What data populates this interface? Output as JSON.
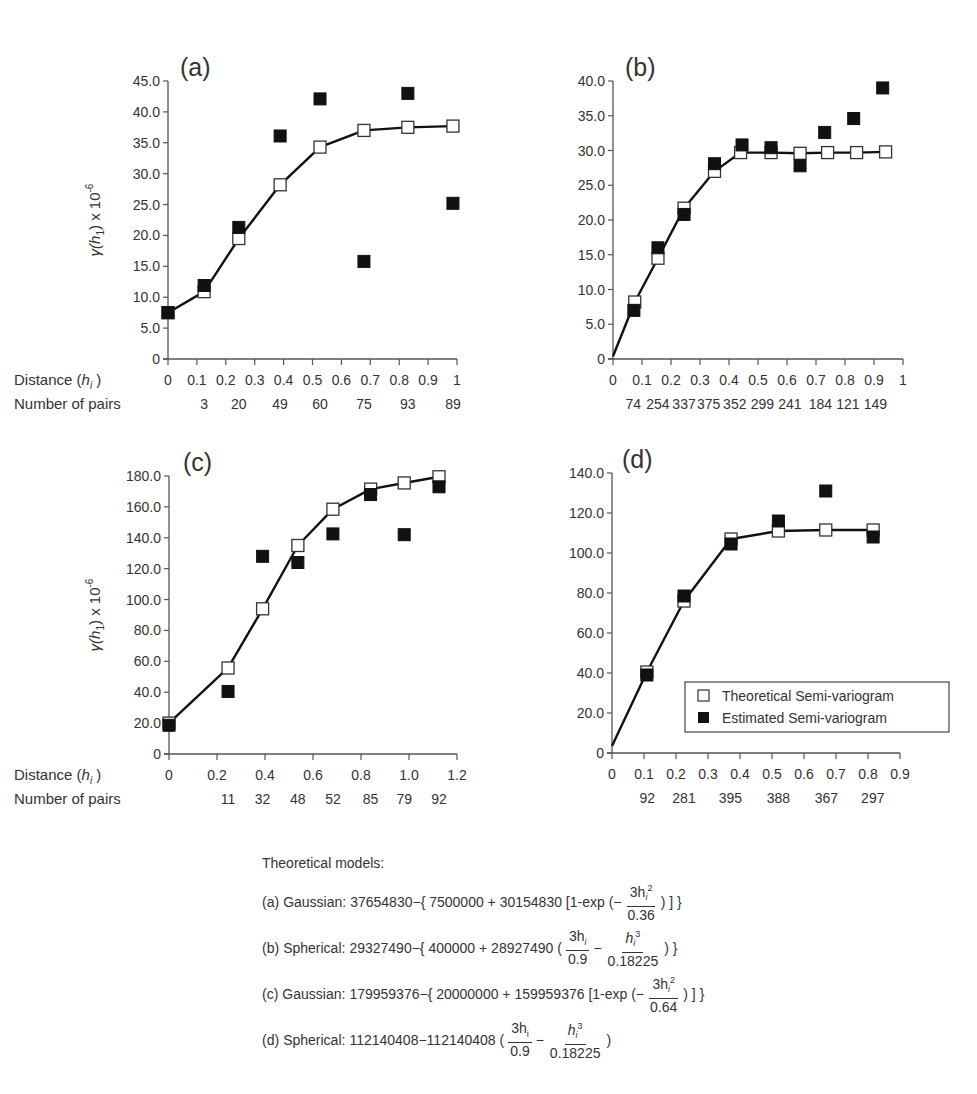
{
  "legend": {
    "theoretical": "Theoretical Semi-variogram",
    "estimated": "Estimated Semi-variogram"
  },
  "common": {
    "distance_label": "Distance (",
    "distance_var": "h",
    "distance_sub": "i",
    "pairs_label": "Number of pairs",
    "ylabel_text": "γ(h",
    "ylabel_sub": "1",
    "ylabel_suffix": ") x 10",
    "ylabel_exp": "-6"
  },
  "models": {
    "heading": "Theoretical models:",
    "a": {
      "tag": "(a)",
      "name": "Gaussian:",
      "expr1": "37654830−{ 7500000 + 30154830 [1-exp (−",
      "num": "3h",
      "num_sub": "i",
      "num_sup": "2",
      "den": "0.36",
      "expr2": ") ] }"
    },
    "b": {
      "tag": "(b)",
      "name": "Spherical:",
      "expr1": "29327490−{ 400000 + 28927490 (",
      "f1_num": "3h",
      "f1_sub": "i",
      "f1_den": "0.9",
      "minus": "−",
      "f2_num": "h",
      "f2_sub": "i",
      "f2_sup": "3",
      "f2_den": "0.18225",
      "expr2": ") }"
    },
    "c": {
      "tag": "(c)",
      "name": "Gaussian:",
      "expr1": "179959376−{ 20000000 + 159959376 [1-exp (−",
      "num": "3h",
      "num_sub": "i",
      "num_sup": "2",
      "den": "0.64",
      "expr2": ") ] }"
    },
    "d": {
      "tag": "(d)",
      "name": "Spherical:",
      "expr1": "112140408−112140408 (",
      "f1_num": "3h",
      "f1_sub": "i",
      "f1_den": "0.9",
      "minus": "−",
      "f2_num": "h",
      "f2_sub": "i",
      "f2_sup": "3",
      "f2_den": "0.18225",
      "expr2": ")"
    }
  },
  "chart_data": [
    {
      "id": "a",
      "type": "line+scatter",
      "title": "(a)",
      "xlabel": "Distance (h_i)",
      "ylabel": "γ(h1) x 10^-6",
      "xlim": [
        0,
        1
      ],
      "ylim": [
        0,
        45
      ],
      "xticks": [
        0,
        0.1,
        0.2,
        0.3,
        0.4,
        0.5,
        0.6,
        0.7,
        0.8,
        0.9,
        1
      ],
      "xtick_labels": [
        "0",
        "0.1",
        "0.2",
        "0.3",
        "0.4",
        "0.5",
        "0.6",
        "0.7",
        "0.8",
        "0.9",
        "1"
      ],
      "yticks": [
        0,
        5,
        10,
        15,
        20,
        25,
        30,
        35,
        40,
        45
      ],
      "ytick_labels": [
        "0",
        "5.0",
        "10.0",
        "15.0",
        "20.0",
        "25.0",
        "30.0",
        "35.0",
        "40.0",
        "45.0"
      ],
      "show_row_labels": true,
      "pairs": [
        {
          "x": 0.125,
          "n": "3"
        },
        {
          "x": 0.245,
          "n": "20"
        },
        {
          "x": 0.388,
          "n": "49"
        },
        {
          "x": 0.526,
          "n": "60"
        },
        {
          "x": 0.678,
          "n": "75"
        },
        {
          "x": 0.83,
          "n": "93"
        },
        {
          "x": 0.986,
          "n": "89"
        }
      ],
      "series": [
        {
          "name": "Theoretical Semi-variogram",
          "style": "open-square-line",
          "x": [
            0,
            0.125,
            0.245,
            0.388,
            0.526,
            0.678,
            0.83,
            0.986
          ],
          "y": [
            7.5,
            10.9,
            19.5,
            28.2,
            34.3,
            37.0,
            37.5,
            37.7
          ]
        },
        {
          "name": "Estimated Semi-variogram",
          "style": "filled-square",
          "x": [
            0,
            0.125,
            0.245,
            0.388,
            0.526,
            0.678,
            0.83,
            0.986
          ],
          "y": [
            7.5,
            11.9,
            21.3,
            36.1,
            42.1,
            15.8,
            43.0,
            25.2
          ]
        }
      ]
    },
    {
      "id": "b",
      "type": "line+scatter",
      "title": "(b)",
      "xlabel": "Distance (h_i)",
      "ylabel": "",
      "xlim": [
        0,
        1
      ],
      "ylim": [
        0,
        40
      ],
      "xticks": [
        0,
        0.1,
        0.2,
        0.3,
        0.4,
        0.5,
        0.6,
        0.7,
        0.8,
        0.9,
        1
      ],
      "xtick_labels": [
        "0",
        "0.1",
        "0.2",
        "0.3",
        "0.4",
        "0.5",
        "0.6",
        "0.7",
        "0.8",
        "0.9",
        "1"
      ],
      "yticks": [
        0,
        5,
        10,
        15,
        20,
        25,
        30,
        35,
        40
      ],
      "ytick_labels": [
        "0",
        "5.0",
        "10.0",
        "15.0",
        "20.0",
        "25.0",
        "30.0",
        "35.0",
        "40.0"
      ],
      "show_row_labels": false,
      "pairs": [
        {
          "x": 0.07,
          "n": "74"
        },
        {
          "x": 0.155,
          "n": "254"
        },
        {
          "x": 0.245,
          "n": "337"
        },
        {
          "x": 0.33,
          "n": "375"
        },
        {
          "x": 0.42,
          "n": "352"
        },
        {
          "x": 0.515,
          "n": "299"
        },
        {
          "x": 0.61,
          "n": "241"
        },
        {
          "x": 0.715,
          "n": "184"
        },
        {
          "x": 0.81,
          "n": "121"
        },
        {
          "x": 0.905,
          "n": "149"
        }
      ],
      "series": [
        {
          "name": "Theoretical Semi-variogram",
          "style": "open-square-line",
          "line_start": [
            0,
            0.4
          ],
          "x": [
            0.075,
            0.155,
            0.245,
            0.35,
            0.44,
            0.545,
            0.645,
            0.74,
            0.84,
            0.94
          ],
          "y": [
            8.2,
            14.5,
            21.7,
            27.0,
            29.7,
            29.7,
            29.6,
            29.7,
            29.7,
            29.8
          ]
        },
        {
          "name": "Estimated Semi-variogram",
          "style": "filled-square",
          "x": [
            0.072,
            0.155,
            0.245,
            0.35,
            0.445,
            0.545,
            0.645,
            0.73,
            0.83,
            0.93
          ],
          "y": [
            7.0,
            16.0,
            20.8,
            28.1,
            30.8,
            30.4,
            27.8,
            32.6,
            34.6,
            39.0
          ]
        }
      ]
    },
    {
      "id": "c",
      "type": "line+scatter",
      "title": "(c)",
      "xlabel": "Distance (h_i)",
      "ylabel": "γ(h1) x 10^-6",
      "xlim": [
        0,
        1.2
      ],
      "ylim": [
        0,
        180
      ],
      "xticks": [
        0,
        0.2,
        0.4,
        0.6,
        0.8,
        1.0,
        1.2
      ],
      "xtick_labels": [
        "0",
        "0.2",
        "0.4",
        "0.6",
        "0.8",
        "1.0",
        "1.2"
      ],
      "yticks": [
        0,
        20,
        40,
        60,
        80,
        100,
        120,
        140,
        160,
        180
      ],
      "ytick_labels": [
        "0",
        "20.0",
        "40.0",
        "60.0",
        "80.0",
        "100.0",
        "120.0",
        "140.0",
        "160.0",
        "180.0"
      ],
      "show_row_labels": true,
      "pairs": [
        {
          "x": 0.246,
          "n": "11"
        },
        {
          "x": 0.39,
          "n": "32"
        },
        {
          "x": 0.537,
          "n": "48"
        },
        {
          "x": 0.683,
          "n": "52"
        },
        {
          "x": 0.84,
          "n": "85"
        },
        {
          "x": 0.98,
          "n": "79"
        },
        {
          "x": 1.125,
          "n": "92"
        }
      ],
      "series": [
        {
          "name": "Theoretical Semi-variogram",
          "style": "open-square-line",
          "x": [
            0,
            0.246,
            0.39,
            0.537,
            0.683,
            0.84,
            0.98,
            1.125
          ],
          "y": [
            20.0,
            55.7,
            94.0,
            135.0,
            158.5,
            171.5,
            175.5,
            179.5
          ]
        },
        {
          "name": "Estimated Semi-variogram",
          "style": "filled-square",
          "x": [
            0,
            0.246,
            0.39,
            0.537,
            0.683,
            0.84,
            0.98,
            1.125
          ],
          "y": [
            18.6,
            40.5,
            128.0,
            124.0,
            142.5,
            168.0,
            142.0,
            173.0
          ]
        }
      ]
    },
    {
      "id": "d",
      "type": "line+scatter",
      "title": "(d)",
      "xlabel": "Distance (h_i)",
      "ylabel": "",
      "xlim": [
        0,
        0.9
      ],
      "ylim": [
        0,
        140
      ],
      "xticks": [
        0,
        0.1,
        0.2,
        0.3,
        0.4,
        0.5,
        0.6,
        0.7,
        0.8,
        0.9
      ],
      "xtick_labels": [
        "0",
        "0.1",
        "0.2",
        "0.3",
        "0.4",
        "0.5",
        "0.6",
        "0.7",
        "0.8",
        "0.9"
      ],
      "yticks": [
        0,
        20,
        40,
        60,
        80,
        100,
        120,
        140
      ],
      "ytick_labels": [
        "0",
        "20.0",
        "40.0",
        "60.0",
        "80.0",
        "100.0",
        "120.0",
        "140.0"
      ],
      "show_row_labels": false,
      "legend": true,
      "pairs": [
        {
          "x": 0.11,
          "n": "92"
        },
        {
          "x": 0.225,
          "n": "281"
        },
        {
          "x": 0.37,
          "n": "395"
        },
        {
          "x": 0.52,
          "n": "388"
        },
        {
          "x": 0.67,
          "n": "367"
        },
        {
          "x": 0.815,
          "n": "297"
        }
      ],
      "series": [
        {
          "name": "Theoretical Semi-variogram",
          "style": "open-square-line",
          "line_start": [
            0,
            3.5
          ],
          "x": [
            0.109,
            0.225,
            0.372,
            0.52,
            0.668,
            0.816
          ],
          "y": [
            40.5,
            76.0,
            107.0,
            111.0,
            111.5,
            111.5
          ]
        },
        {
          "name": "Estimated Semi-variogram",
          "style": "filled-square",
          "x": [
            0.109,
            0.225,
            0.372,
            0.52,
            0.668,
            0.816
          ],
          "y": [
            39.0,
            78.5,
            104.5,
            116.0,
            131.0,
            108.0
          ]
        }
      ]
    }
  ],
  "layout": {
    "panels": {
      "a": {
        "x0": 168,
        "x1": 457,
        "y0": 359,
        "y1": 81,
        "title_x": 180,
        "title_y": 76
      },
      "b": {
        "x0": 613,
        "x1": 903,
        "y0": 359,
        "y1": 81,
        "title_x": 625,
        "title_y": 76
      },
      "c": {
        "x0": 169,
        "x1": 457,
        "y0": 754,
        "y1": 476,
        "title_x": 183,
        "title_y": 471
      },
      "d": {
        "x0": 612,
        "x1": 900,
        "y0": 753,
        "y1": 473,
        "title_x": 622,
        "title_y": 468
      }
    }
  }
}
